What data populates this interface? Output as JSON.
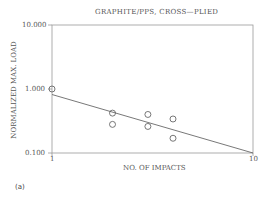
{
  "chart_data": {
    "type": "scatter",
    "title": "GRAPHITE/PPS, CROSS—PLIED",
    "xlabel": "NO. OF IMPACTS",
    "ylabel": "NORMALIZED MAX. LOAD",
    "xscale": "log",
    "yscale": "log",
    "xlim": [
      1,
      10
    ],
    "ylim": [
      0.1,
      10
    ],
    "x_ticks": [
      "1",
      "10"
    ],
    "y_ticks": [
      "0.100",
      "1.000",
      "10.000"
    ],
    "grid": false,
    "legend": null,
    "series": [
      {
        "name": "data",
        "marker": "open-circle",
        "points": [
          {
            "x": 1,
            "y": 1.0
          },
          {
            "x": 2,
            "y": 0.42
          },
          {
            "x": 2,
            "y": 0.28
          },
          {
            "x": 3,
            "y": 0.4
          },
          {
            "x": 3,
            "y": 0.26
          },
          {
            "x": 4,
            "y": 0.34
          },
          {
            "x": 4,
            "y": 0.17
          }
        ]
      },
      {
        "name": "fit",
        "type": "line",
        "points": [
          {
            "x": 1,
            "y": 0.82
          },
          {
            "x": 10,
            "y": 0.1
          }
        ]
      }
    ]
  },
  "caption": "(a)"
}
